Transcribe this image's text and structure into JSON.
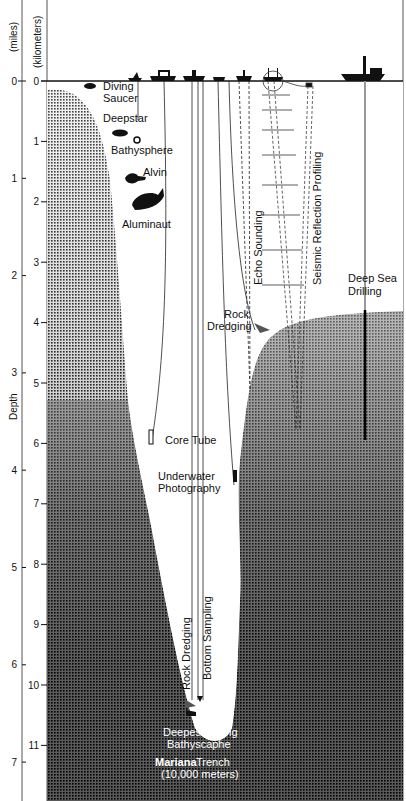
{
  "axes": {
    "miles_label": "(miles)",
    "km_label": "(kilometers)",
    "depth_label": "Depth",
    "km_ticks": [
      "0",
      "1",
      "2",
      "3",
      "4",
      "5",
      "6",
      "7",
      "8",
      "9",
      "10",
      "11"
    ],
    "mile_ticks": [
      "0",
      "1",
      "2",
      "3",
      "4",
      "5",
      "6",
      "7"
    ]
  },
  "labels": {
    "diving_saucer_1": "Diving",
    "diving_saucer_2": "Saucer",
    "deepstar": "Deepstar",
    "bathysphere": "Bathysphere",
    "alvin": "Alvin",
    "aluminaut": "Aluminaut",
    "echo_sounding": "Echo Sounding",
    "seismic": "Seismic Reflection Profiling",
    "deep_sea_1": "Deep Sea",
    "deep_sea_2": "Drilling",
    "rock_dredging_1": "Rock",
    "rock_dredging_2": "Dredging",
    "core_tube": "Core Tube",
    "underwater_1": "Underwater",
    "underwater_2": "Photography",
    "rock_dredging_deep": "Rock Dredging",
    "bottom_sampling": "Bottom Sampling",
    "bathyscaphe_1": "Deepest Diving",
    "bathyscaphe_2": "Bathyscaphe",
    "mariana_1": "Mariana",
    "mariana_1b": "Trench",
    "mariana_2": "(10,000 meters)"
  }
}
